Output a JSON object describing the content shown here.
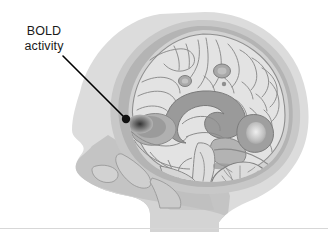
{
  "figure": {
    "kind": "sagittal-brain-illustration",
    "width": 328,
    "height": 235,
    "background_color": "#ffffff"
  },
  "annotation": {
    "label_line1": "BOLD",
    "label_line2": "activity",
    "label_text": "BOLD\nactivity",
    "text_color": "#1a1a1a",
    "leader_line_color": "#000000",
    "leader_line_start": [
      63,
      56
    ],
    "leader_line_end": [
      126,
      119
    ],
    "marker_shape": "filled-circle",
    "marker_center": [
      126,
      119
    ],
    "marker_radius": 4.2
  },
  "anatomy": {
    "bold_activity_region": "BOLD activity",
    "structures": [
      "scalp",
      "skull",
      "dura",
      "cerebral cortex",
      "corpus callosum",
      "thalamus",
      "brainstem",
      "cerebellum",
      "spinal cord",
      "face",
      "neck"
    ]
  },
  "palette": {
    "scalp": "#dcdcdc",
    "skull_outer": "#c8c8c8",
    "skull_band": "#b4b4b4",
    "inner_table": "#d2d2d2",
    "cortex": "#e3e3e3",
    "cortex_outline": "#8a8a8a",
    "deep_gray": "#a0a0a0",
    "corpus_callosum": "#9a9a9a",
    "cerebellum": "#d8d8d8",
    "brainstem": "#dedede",
    "face": "#c4c4c4",
    "neck": "#d0d0d0",
    "bold_spot": "#3a3a3a",
    "divider": "#d7d7d7"
  },
  "divider": {
    "visible": true,
    "y": 228,
    "color": "#d7d7d7"
  }
}
